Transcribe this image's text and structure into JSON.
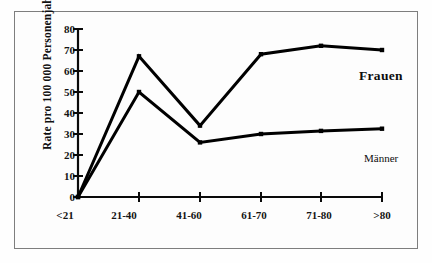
{
  "chart_data": {
    "type": "line",
    "title": "",
    "xlabel": "",
    "ylabel": "Rate pro 100 000 Personenjahre",
    "categories": [
      "<21",
      "21-40",
      "41-60",
      "61-70",
      "71-80",
      ">80"
    ],
    "series": [
      {
        "name": "Frauen",
        "values": [
          0,
          67,
          34,
          68,
          72,
          70
        ]
      },
      {
        "name": "Männer",
        "values": [
          0,
          50,
          26,
          30,
          31.5,
          32.5
        ]
      }
    ],
    "ylim": [
      0,
      80
    ],
    "yticks": [
      0,
      10,
      20,
      30,
      40,
      50,
      60,
      70,
      80
    ],
    "grid": false,
    "legend_position": "inline-right",
    "line_color": "#000000",
    "marker": "square",
    "frame_color": "#7e7e7e",
    "background": "#ffffff"
  },
  "axis": {
    "y_tick_labels": [
      "80",
      "70",
      "60",
      "50",
      "40",
      "30",
      "20",
      "10",
      "0"
    ],
    "x_tick_labels": [
      "<21",
      "21-40",
      "41-60",
      "61-70",
      "71-80",
      ">80"
    ],
    "y_axis_title": "Rate pro 100 000 Personenjahre"
  },
  "labels": {
    "frauen": "Frauen",
    "maenner": "Männer"
  }
}
